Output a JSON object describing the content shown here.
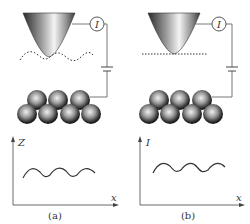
{
  "figure": {
    "panels": [
      {
        "id": "a",
        "caption": "(a)",
        "mode": "constant current",
        "meter_label": "I",
        "tip_path": "dotted wavy trajectory following surface",
        "graph": {
          "y_axis_label": "Z",
          "x_axis_label": "x",
          "curve": "sinusoidal"
        }
      },
      {
        "id": "b",
        "caption": "(b)",
        "mode": "constant height",
        "meter_label": "I",
        "tip_path": "dashed straight line at constant height",
        "graph": {
          "y_axis_label": "I",
          "x_axis_label": "x",
          "curve": "sinusoidal"
        }
      }
    ],
    "atoms": {
      "top_row": 3,
      "bottom_row": 4
    },
    "colors": {
      "line": "#555555",
      "tip_dark": "#333333",
      "tip_light": "#f2f2f2",
      "atom_dark": "#1a1a1a",
      "atom_light": "#e6e6e6"
    }
  }
}
